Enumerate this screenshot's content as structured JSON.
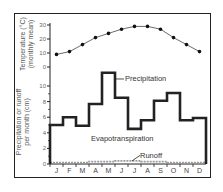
{
  "chart_data": [
    {
      "type": "line",
      "title": "",
      "ylabel": "Temperature (°C) (monthly mean)",
      "ylabel_line1": "Temperature (°C)",
      "ylabel_line2": "(monthly mean)",
      "categories": [
        "J",
        "F",
        "M",
        "A",
        "M",
        "J",
        "J",
        "A",
        "S",
        "O",
        "N",
        "D"
      ],
      "values": [
        9,
        11,
        16,
        21,
        24,
        27,
        29,
        29,
        27,
        21,
        16,
        11
      ],
      "yticks": [
        0,
        10,
        20,
        30
      ],
      "ylim": [
        0,
        30
      ],
      "grid": false,
      "marker": "circle"
    },
    {
      "type": "bar",
      "style": "step",
      "ylabel": "Precipitation or runoff per month (cm)",
      "ylabel_line1": "Precipitation or runoff",
      "ylabel_line2": "per month (cm)",
      "categories": [
        "J",
        "F",
        "M",
        "A",
        "M",
        "J",
        "J",
        "A",
        "S",
        "O",
        "N",
        "D"
      ],
      "series": [
        {
          "name": "Precipitation",
          "values": [
            5.0,
            6.0,
            4.9,
            7.7,
            11.7,
            8.5,
            4.5,
            5.6,
            8.1,
            9.1,
            5.6,
            5.9
          ]
        },
        {
          "name": "Runoff",
          "values": [
            0.2,
            0.2,
            0.2,
            0.3,
            0.3,
            0.4,
            0.4,
            0.3,
            0.3,
            0.2,
            0.2,
            0.2
          ]
        }
      ],
      "annotations": [
        "Precipitation",
        "Evapotranspiration",
        "Runoff"
      ],
      "yticks": [
        0,
        2,
        4,
        6,
        8,
        10
      ],
      "ylim": [
        0,
        12
      ],
      "grid": false
    }
  ],
  "labels": {
    "temp_y1": "Temperature (°C)",
    "temp_y2": "(monthly mean)",
    "precip_y1": "Precipitation or runoff",
    "precip_y2": "per month (cm)",
    "precipitation": "Precipitation",
    "evapotranspiration": "Evapotranspiration",
    "runoff": "Runoff"
  },
  "colors": {
    "line": "#222222",
    "runoff": "#9a9a9a",
    "text": "#444444"
  }
}
